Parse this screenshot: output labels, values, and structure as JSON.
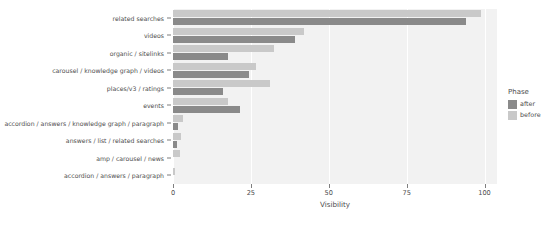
{
  "chart_data": {
    "type": "bar",
    "orientation": "horizontal",
    "title": "",
    "xlabel": "Visibility",
    "ylabel": "",
    "xlim": [
      0,
      104
    ],
    "xticks": [
      0,
      25,
      50,
      75,
      100
    ],
    "xtick_labels": [
      "0",
      "25",
      "50",
      "75",
      "100"
    ],
    "grid": true,
    "grid_axis": "x",
    "legend": {
      "title": "Phase",
      "position": "right",
      "entries": [
        {
          "name": "after",
          "color": "#8a8a8a"
        },
        {
          "name": "before",
          "color": "#c9c9c9"
        }
      ]
    },
    "categories": [
      "related searches",
      "videos",
      "organic / sitelinks",
      "carousel / knowledge graph / videos",
      "places/v3 / ratings",
      "events",
      "accordion / answers / knowledge graph / paragraph",
      "answers / list / related searches",
      "amp / carousel / news",
      "accordion / answers / paragraph"
    ],
    "series": [
      {
        "name": "before",
        "color": "#c9c9c9",
        "values": [
          99.0,
          42.0,
          32.5,
          26.5,
          31.0,
          17.5,
          3.2,
          2.6,
          2.2,
          0.5
        ]
      },
      {
        "name": "after",
        "color": "#8a8a8a",
        "values": [
          94.0,
          39.0,
          17.5,
          24.5,
          16.0,
          21.5,
          1.6,
          1.4,
          0.0,
          0.0
        ]
      }
    ]
  },
  "axis": {
    "x_title": "Visibility"
  },
  "style": {
    "plot_background": "#f2f2f2",
    "gridline_color": "#ffffff",
    "text_color": "#4d4d4d",
    "page_background": "#ffffff"
  }
}
